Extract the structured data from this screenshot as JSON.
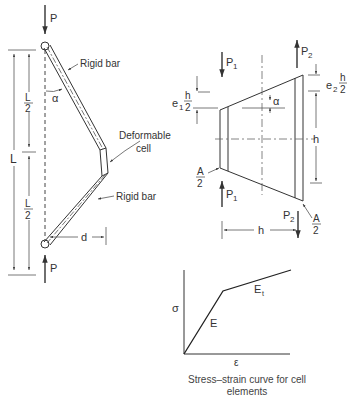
{
  "left_figure": {
    "load_top": "P",
    "load_bottom": "P",
    "total_length": "L",
    "half_length_top_num": "L",
    "half_length_top_den": "2",
    "half_length_bottom_num": "L",
    "half_length_bottom_den": "2",
    "angle": "α",
    "upper_bar_label": "Rigid bar",
    "lower_bar_label": "Rigid bar",
    "cell_label_line1": "Deformable",
    "cell_label_line2": "cell",
    "offset": "d"
  },
  "right_figure": {
    "p1_top": "P",
    "p1_top_sub": "1",
    "p2_top": "P",
    "p2_top_sub": "2",
    "p1_bottom": "P",
    "p1_bottom_sub": "1",
    "p2_bottom": "P",
    "p2_bottom_sub": "2",
    "e1": "e",
    "e1_sub": "1",
    "e2": "e",
    "e2_sub": "2",
    "h_num": "h",
    "h_den": "2",
    "height": "h",
    "width": "h",
    "angle": "α",
    "area_num": "A",
    "area_den": "2"
  },
  "stress_strain": {
    "y_axis": "σ",
    "x_axis": "ε",
    "elastic_modulus": "E",
    "tangent_modulus": "E",
    "tangent_sub": "t",
    "caption_line1": "Stress–strain curve for cell",
    "caption_line2": "elements"
  }
}
